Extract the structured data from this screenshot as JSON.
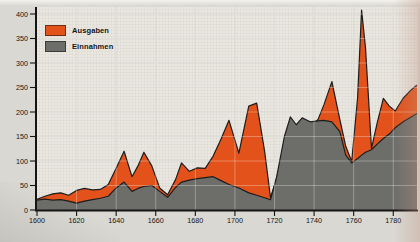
{
  "figure": {
    "legend": [
      {
        "label": "Ausgaben",
        "color": "#e2521a"
      },
      {
        "label": "Einnahmen",
        "color": "#6d6d6a"
      }
    ]
  },
  "chart_data": {
    "type": "area",
    "title": "",
    "xlabel": "",
    "ylabel": "",
    "xlim": [
      1600,
      1792
    ],
    "ylim": [
      0,
      400
    ],
    "x_ticks": [
      1600,
      1620,
      1640,
      1660,
      1680,
      1700,
      1720,
      1740,
      1760,
      1780
    ],
    "y_ticks": [
      0,
      50,
      100,
      150,
      200,
      250,
      300,
      350,
      400
    ],
    "grid": true,
    "legend_position": "top-left",
    "x": [
      1600,
      1604,
      1608,
      1612,
      1616,
      1620,
      1624,
      1628,
      1632,
      1636,
      1640,
      1644,
      1648,
      1651,
      1654,
      1658,
      1662,
      1666,
      1670,
      1673,
      1677,
      1681,
      1685,
      1689,
      1693,
      1697,
      1702,
      1707,
      1711,
      1715,
      1718,
      1721,
      1725,
      1728,
      1731,
      1734,
      1738,
      1742,
      1745,
      1749,
      1753,
      1756,
      1759,
      1762,
      1764,
      1766,
      1769,
      1772,
      1775,
      1778,
      1781,
      1785,
      1789,
      1792
    ],
    "series": [
      {
        "name": "Ausgaben",
        "color": "#e2521a",
        "values": [
          22,
          28,
          33,
          35,
          30,
          40,
          44,
          41,
          42,
          52,
          85,
          120,
          68,
          90,
          118,
          90,
          45,
          31,
          62,
          96,
          79,
          86,
          85,
          110,
          145,
          183,
          116,
          212,
          218,
          120,
          25,
          64,
          120,
          150,
          155,
          160,
          168,
          185,
          215,
          262,
          185,
          130,
          99,
          230,
          408,
          330,
          126,
          180,
          228,
          212,
          202,
          228,
          245,
          255
        ]
      },
      {
        "name": "Einnahmen",
        "color": "#6d6d6a",
        "values": [
          20,
          22,
          20,
          21,
          18,
          14,
          18,
          21,
          24,
          28,
          45,
          57,
          38,
          44,
          48,
          50,
          38,
          26,
          46,
          57,
          61,
          64,
          66,
          68,
          60,
          52,
          45,
          35,
          30,
          25,
          21,
          66,
          150,
          190,
          174,
          188,
          180,
          182,
          183,
          180,
          160,
          112,
          96,
          105,
          112,
          118,
          123,
          135,
          146,
          155,
          168,
          180,
          190,
          197
        ]
      }
    ],
    "style": {
      "plot_bg": "#e9e7e0",
      "page_bg": "#d9d8d2",
      "grid_under": "#c7c5bc",
      "grid_over": "#ffffff",
      "axis": "#141414",
      "outline": "#1d1d1d",
      "label": "#141414"
    }
  }
}
